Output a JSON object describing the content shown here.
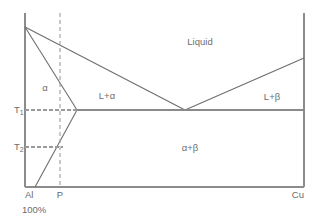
{
  "diagram": {
    "type": "phase-diagram",
    "colors": {
      "axis": "#8c8c8c",
      "boundary": "#6e6e6e",
      "dashed_guide": "#9a9a9a",
      "text": "#6b6b6b",
      "background": "#ffffff"
    },
    "regions": [
      {
        "key": "liquid",
        "label": "Liquid",
        "x": 200,
        "y": 42
      },
      {
        "key": "alpha",
        "label": "α",
        "x": 45,
        "y": 88
      },
      {
        "key": "liquid-plus-alpha",
        "label": "L+α",
        "x": 107,
        "y": 96
      },
      {
        "key": "liquid-plus-beta",
        "label": "L+β",
        "x": 272,
        "y": 97
      },
      {
        "key": "alpha-plus-beta",
        "label": "α+β",
        "x": 190,
        "y": 148
      }
    ],
    "axis_labels": {
      "left_component": "Al",
      "left_component_percent": "100%",
      "right_component": "Cu",
      "composition_marker": "P"
    },
    "temperature_labels": [
      {
        "key": "T1",
        "base": "T",
        "sub": "1",
        "y": 110
      },
      {
        "key": "T2",
        "base": "T",
        "sub": "2",
        "y": 147
      }
    ],
    "geometry": {
      "frame": {
        "left": 25,
        "right": 304,
        "top": 13,
        "bottom": 187
      },
      "melting_point_al": {
        "x": 25,
        "y": 27
      },
      "melting_point_cu": {
        "x": 304,
        "y": 58
      },
      "eutectic_point": {
        "x": 185,
        "y": 110
      },
      "max_solubility_point": {
        "x": 77,
        "y": 110
      },
      "solvus_end": {
        "x": 35,
        "y": 187
      },
      "composition_p_x": 60,
      "eutectic_temperature_y": 110,
      "t2_y": 147,
      "solvus_at_t2_x": 62
    }
  }
}
